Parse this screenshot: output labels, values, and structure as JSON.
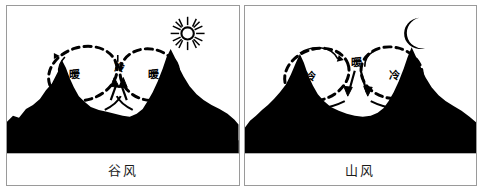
{
  "figure": {
    "type": "diagram",
    "background_color": "#ffffff",
    "border_color": "#9a9a9a",
    "ink_color": "#000000"
  },
  "panels": [
    {
      "id": "valley-wind",
      "caption": "谷风",
      "sky_icon": "sun-icon",
      "sky_icon_glyph": "☀",
      "time_of_day": "day",
      "labels": [
        {
          "text": "暖",
          "meaning": "warm",
          "x": 68,
          "y": 68
        },
        {
          "text": "冷",
          "meaning": "cold",
          "x": 113,
          "y": 62
        },
        {
          "text": "暖",
          "meaning": "warm",
          "x": 147,
          "y": 68
        }
      ],
      "circulations": [
        {
          "name": "left-circulation-loop",
          "direction": "clockwise"
        },
        {
          "name": "right-circulation-loop",
          "direction": "counterclockwise"
        }
      ],
      "flow": "upslope"
    },
    {
      "id": "mountain-wind",
      "caption": "山风",
      "sky_icon": "moon-icon",
      "sky_icon_glyph": "☽",
      "time_of_day": "night",
      "labels": [
        {
          "text": "冷",
          "meaning": "cold",
          "x": 66,
          "y": 72
        },
        {
          "text": "暖",
          "meaning": "warm",
          "x": 112,
          "y": 57
        },
        {
          "text": "冷",
          "meaning": "cold",
          "x": 150,
          "y": 70
        }
      ],
      "circulations": [
        {
          "name": "left-circulation-loop",
          "direction": "counterclockwise"
        },
        {
          "name": "right-circulation-loop",
          "direction": "clockwise"
        }
      ],
      "flow": "downslope"
    }
  ]
}
